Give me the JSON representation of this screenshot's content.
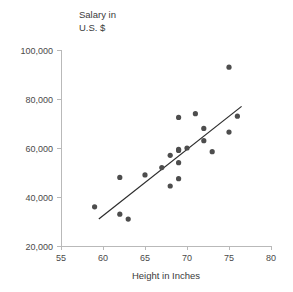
{
  "chart_data": {
    "type": "scatter",
    "title": "",
    "xlabel": "Height in Inches",
    "ylabel_line1": "Salary in",
    "ylabel_line2": "U.S. $",
    "xlim": [
      55,
      80
    ],
    "ylim": [
      20000,
      100000
    ],
    "xticks": [
      "55",
      "60",
      "65",
      "70",
      "75",
      "80"
    ],
    "xtick_values": [
      55,
      60,
      65,
      70,
      75,
      80
    ],
    "yticks": [
      "20,000",
      "40,000",
      "60,000",
      "80,000",
      "100,000"
    ],
    "ytick_values": [
      20000,
      40000,
      60000,
      80000,
      100000
    ],
    "grid": false,
    "legend": "none",
    "point_color": "#4d4d4d",
    "line_color": "#2b2b2b",
    "axis_color": "#b9b9b9",
    "x": [
      59,
      62,
      62,
      63,
      65,
      67,
      68,
      68,
      69,
      69,
      69,
      69,
      69,
      70,
      71,
      72,
      72,
      73,
      75,
      75,
      76
    ],
    "y": [
      36000,
      48000,
      33000,
      31000,
      49000,
      52000,
      57000,
      44500,
      59000,
      59500,
      54000,
      47500,
      72500,
      60000,
      74000,
      68000,
      63000,
      58500,
      93000,
      66500,
      73000
    ],
    "points": [
      {
        "x": 59,
        "y": 36000
      },
      {
        "x": 62,
        "y": 48000
      },
      {
        "x": 62,
        "y": 33000
      },
      {
        "x": 63,
        "y": 31000
      },
      {
        "x": 65,
        "y": 49000
      },
      {
        "x": 67,
        "y": 52000
      },
      {
        "x": 68,
        "y": 57000
      },
      {
        "x": 68,
        "y": 44500
      },
      {
        "x": 69,
        "y": 59000
      },
      {
        "x": 69,
        "y": 59500
      },
      {
        "x": 69,
        "y": 54000
      },
      {
        "x": 69,
        "y": 47500
      },
      {
        "x": 69,
        "y": 72500
      },
      {
        "x": 70,
        "y": 60000
      },
      {
        "x": 71,
        "y": 74000
      },
      {
        "x": 72,
        "y": 68000
      },
      {
        "x": 72,
        "y": 63000
      },
      {
        "x": 73,
        "y": 58500
      },
      {
        "x": 75,
        "y": 93000
      },
      {
        "x": 75,
        "y": 66500
      },
      {
        "x": 76,
        "y": 73000
      }
    ],
    "trend_line": {
      "x_start": 59.5,
      "y_start": 31000,
      "x_end": 76.5,
      "y_end": 77000
    }
  }
}
